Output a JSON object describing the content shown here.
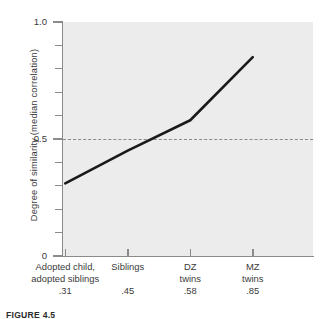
{
  "chart_data": {
    "type": "line",
    "title": "",
    "subtitle": "",
    "xlabel": "",
    "ylabel": "Degree of similarity (median correlation)",
    "categories": [
      "Adopted child,\nadopted siblings",
      "Siblings",
      "DZ\ntwins",
      "MZ\ntwins"
    ],
    "category_value_labels": [
      ".31",
      ".45",
      ".58",
      ".85"
    ],
    "values": [
      0.31,
      0.45,
      0.58,
      0.85
    ],
    "series": [
      {
        "name": "Median correlation",
        "values": [
          0.31,
          0.45,
          0.58,
          0.85
        ]
      }
    ],
    "ylim": [
      0,
      1.0
    ],
    "y_tick_labels": [
      "1.0",
      "0.5",
      "0"
    ],
    "y_tick_values": [
      1.0,
      0.5,
      0
    ],
    "y_minor_tick_values": [
      0.9,
      0.8,
      0.7,
      0.6,
      0.4,
      0.3,
      0.2,
      0.1
    ],
    "grid": false,
    "legend": "none",
    "annotations": [
      {
        "type": "reference-line",
        "orientation": "horizontal",
        "value": 0.5,
        "style": "dashed",
        "color": "#8a8a8a"
      }
    ],
    "colors": {
      "line": "#1a1a1a",
      "plot_background": "#ececec",
      "axis": "#8b8b8b",
      "text": "#3a3a3a",
      "reference_line": "#8a8a8a"
    }
  },
  "caption": {
    "text": "FIGURE 4.5"
  }
}
